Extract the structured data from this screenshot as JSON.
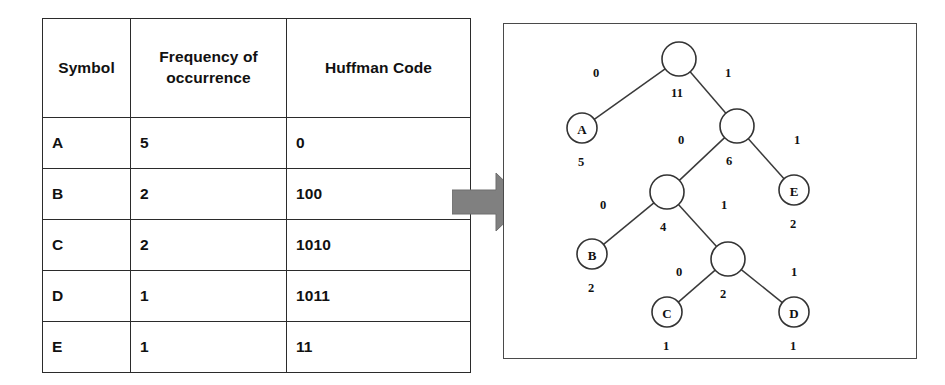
{
  "table": {
    "headers": [
      "Symbol",
      "Frequency of occurrence",
      "Huffman Code"
    ],
    "rows": [
      {
        "symbol": "A",
        "frequency": "5",
        "code": "0"
      },
      {
        "symbol": "B",
        "frequency": "2",
        "code": "100"
      },
      {
        "symbol": "C",
        "frequency": "2",
        "code": "1010"
      },
      {
        "symbol": "D",
        "frequency": "1",
        "code": "1011"
      },
      {
        "symbol": "E",
        "frequency": "1",
        "code": "11"
      }
    ]
  },
  "arrow": {
    "icon": "right-block-arrow-icon",
    "color": "#808080"
  },
  "tree": {
    "nodes": [
      {
        "id": "root",
        "label": "",
        "weight": "11",
        "cx": 175,
        "cy": 35,
        "r": 17,
        "leaf": false,
        "weight_dx": -2,
        "weight_dy": 38
      },
      {
        "id": "n6",
        "label": "",
        "weight": "6",
        "cx": 233,
        "cy": 102,
        "r": 17,
        "leaf": false,
        "weight_dx": -8,
        "weight_dy": 39
      },
      {
        "id": "n4",
        "label": "",
        "weight": "4",
        "cx": 163,
        "cy": 168,
        "r": 17,
        "leaf": false,
        "weight_dx": -4,
        "weight_dy": 39
      },
      {
        "id": "n2",
        "label": "",
        "weight": "2",
        "cx": 224,
        "cy": 235,
        "r": 17,
        "leaf": false,
        "weight_dx": -5,
        "weight_dy": 39
      },
      {
        "id": "leafA",
        "label": "A",
        "weight": "5",
        "cx": 78,
        "cy": 104,
        "r": 15,
        "leaf": true,
        "weight_dx": -1,
        "weight_dy": 38
      },
      {
        "id": "leafE",
        "label": "E",
        "weight": "2",
        "cx": 290,
        "cy": 166,
        "r": 15,
        "leaf": true,
        "weight_dx": -1,
        "weight_dy": 38
      },
      {
        "id": "leafB",
        "label": "B",
        "weight": "2",
        "cx": 88,
        "cy": 230,
        "r": 15,
        "leaf": true,
        "weight_dx": -1,
        "weight_dy": 38
      },
      {
        "id": "leafC",
        "label": "C",
        "weight": "1",
        "cx": 163,
        "cy": 288,
        "r": 15,
        "leaf": true,
        "weight_dx": -1,
        "weight_dy": 38
      },
      {
        "id": "leafD",
        "label": "D",
        "weight": "1",
        "cx": 290,
        "cy": 288,
        "r": 15,
        "leaf": true,
        "weight_dx": -1,
        "weight_dy": 38
      }
    ],
    "edges": [
      {
        "from": "root",
        "to": "leafA",
        "bit": "0",
        "lx": 92,
        "ly": 53
      },
      {
        "from": "root",
        "to": "n6",
        "bit": "1",
        "lx": 224,
        "ly": 53
      },
      {
        "from": "n6",
        "to": "n4",
        "bit": "0",
        "lx": 177,
        "ly": 120
      },
      {
        "from": "n6",
        "to": "leafE",
        "bit": "1",
        "lx": 293,
        "ly": 120
      },
      {
        "from": "n4",
        "to": "leafB",
        "bit": "0",
        "lx": 99,
        "ly": 185
      },
      {
        "from": "n4",
        "to": "n2",
        "bit": "1",
        "lx": 220,
        "ly": 185
      },
      {
        "from": "n2",
        "to": "leafC",
        "bit": "0",
        "lx": 175,
        "ly": 252
      },
      {
        "from": "n2",
        "to": "leafD",
        "bit": "1",
        "lx": 290,
        "ly": 252
      }
    ]
  }
}
